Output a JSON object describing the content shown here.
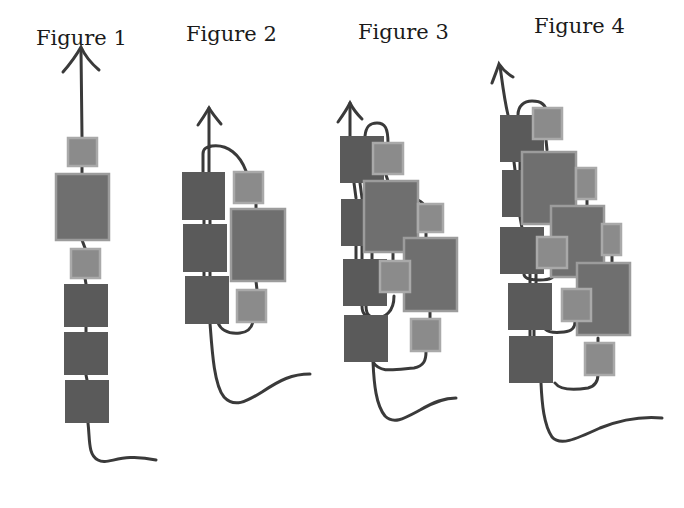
{
  "figures": [
    {
      "id": 1,
      "label": "Figure 1",
      "title_pos": [
        36,
        26
      ]
    },
    {
      "id": 2,
      "label": "Figure 2",
      "title_pos": [
        186,
        22
      ]
    },
    {
      "id": 3,
      "label": "Figure 3",
      "title_pos": [
        358,
        20
      ]
    },
    {
      "id": 4,
      "label": "Figure 4",
      "title_pos": [
        534,
        14
      ]
    }
  ],
  "colors": {
    "background": "#ffffff",
    "line": "#3a3a3a",
    "dark_box": "#5a5a5a",
    "medium_box": "#6f6f6f",
    "medium_box_border": "#9c9c9c",
    "light_box": "#8b8b8b",
    "light_box_border": "#a9a9a9",
    "title_text": "#1a1a1a"
  }
}
